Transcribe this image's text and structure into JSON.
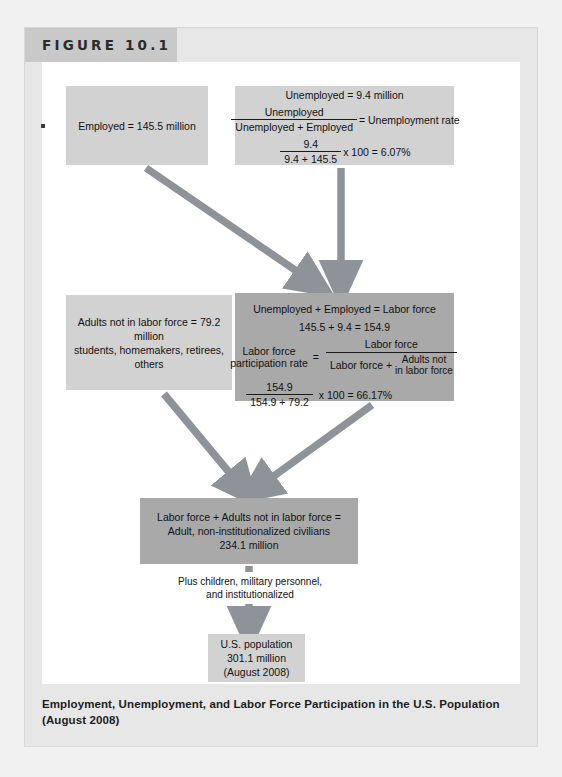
{
  "figure": {
    "header_label": "FIGURE 10.1",
    "caption": "Employment, Unemployment, and Labor Force Participation in the U.S. Population (August 2008)"
  },
  "colors": {
    "page_bg": "#f1f1f1",
    "figure_bg": "#e7e7e7",
    "panel_bg": "#ffffff",
    "header_band": "#c9c9c9",
    "box_light": "#d2d2d2",
    "box_mid": "#a9a9a9",
    "arrow": "#8d9399",
    "text": "#111111"
  },
  "boxes": {
    "employed": {
      "text": "Employed = 145.5 million"
    },
    "unemployed": {
      "line1": "Unemployed = 9.4 million",
      "formula_num": "Unemployed",
      "formula_den": "Unemployed + Employed",
      "formula_equals": "= Unemployment rate",
      "calc_num": "9.4",
      "calc_den": "9.4 + 145.5",
      "calc_tail": "x 100 = 6.07%"
    },
    "not_in_labor_force": {
      "line1": "Adults not in labor force = 79.2 million",
      "line2": "students, homemakers, retirees,",
      "line3": "others"
    },
    "labor_force": {
      "line1": "Unemployed + Employed = Labor force",
      "line2": "145.5 + 9.4 = 154.9",
      "rate_label_1": "Labor force",
      "rate_label_2": "participation rate",
      "equals": "=",
      "frac_num": "Labor force",
      "frac_den_left": "Labor force +",
      "frac_den_right_1": "Adults not",
      "frac_den_right_2": "in labor force",
      "calc_num": "154.9",
      "calc_den": "154.9 + 79.2",
      "calc_tail": "x 100 = 66.17%"
    },
    "civilians": {
      "line1": "Labor force + Adults not in labor force =",
      "line2": "Adult, non-institutionalized civilians",
      "line3": "234.1 million"
    },
    "us_population": {
      "line1": "U.S. population",
      "line2": "301.1 million",
      "line3": "(August 2008)"
    }
  },
  "connector": {
    "line1": "Plus children, military personnel,",
    "line2": "and institutionalized"
  }
}
